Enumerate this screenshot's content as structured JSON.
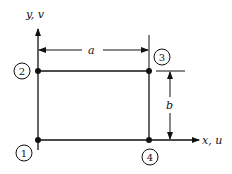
{
  "diagram": {
    "type": "rectangular-element",
    "axes": {
      "y_label": "y, v",
      "x_label": "x, u"
    },
    "dimensions": {
      "width_label": "a",
      "height_label": "b"
    },
    "nodes": [
      {
        "id": "1",
        "label": "1",
        "position": "bottom-left"
      },
      {
        "id": "2",
        "label": "2",
        "position": "top-left"
      },
      {
        "id": "3",
        "label": "3",
        "position": "top-right"
      },
      {
        "id": "4",
        "label": "4",
        "position": "bottom-right"
      }
    ],
    "colors": {
      "line": "#111111",
      "background": "#ffffff"
    }
  }
}
